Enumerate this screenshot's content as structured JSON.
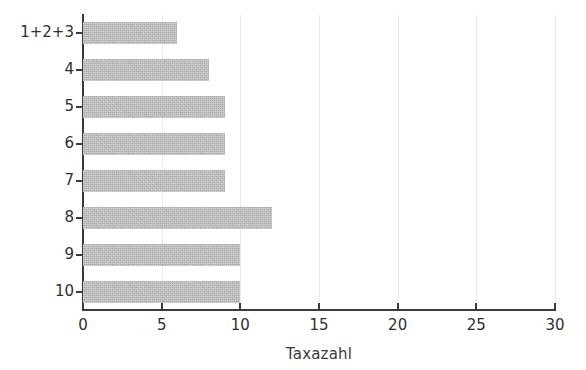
{
  "chart_data": {
    "type": "bar",
    "orientation": "horizontal",
    "title": "",
    "xlabel": "Taxazahl",
    "ylabel": "Plana",
    "categories": [
      "1+2+3",
      "4",
      "5",
      "6",
      "7",
      "8",
      "9",
      "10"
    ],
    "values": [
      6,
      8,
      9,
      9,
      9,
      12,
      10,
      10
    ],
    "xlim": [
      0,
      30
    ],
    "xticks": [
      "0",
      "5",
      "10",
      "15",
      "20",
      "25",
      "30"
    ],
    "xtick_values": [
      0,
      5,
      10,
      15,
      20,
      25,
      30
    ],
    "grid": "vertical-light",
    "legend": null,
    "bar_color": "#aeaeae",
    "axis_color": "#3b3b3b",
    "gridline_color": "#e9e9e9",
    "text_color": "#2f2f2f",
    "background": "#ffffff"
  }
}
